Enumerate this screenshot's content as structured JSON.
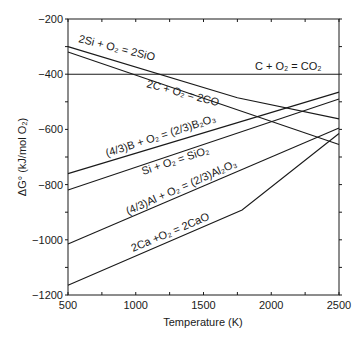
{
  "chart_data": {
    "type": "line",
    "title": "",
    "xlabel": "Temperature (K)",
    "ylabel": "ΔG° (kJ/mol O₂)",
    "xlim": [
      500,
      2500
    ],
    "ylim": [
      -1200,
      -200
    ],
    "x_ticks": [
      500,
      1000,
      1500,
      2000,
      2500
    ],
    "y_ticks": [
      -200,
      -400,
      -600,
      -800,
      -1000,
      -1200
    ],
    "grid": false,
    "legend": "inline labels",
    "series": [
      {
        "name": "2Si + O2 = 2SiO",
        "points": [
          [
            500,
            -300
          ],
          [
            1750,
            -485
          ],
          [
            2500,
            -562
          ]
        ]
      },
      {
        "name": "2C + O2 = 2CO",
        "points": [
          [
            500,
            -320
          ],
          [
            2500,
            -655
          ]
        ]
      },
      {
        "name": "C + O2 = CO2",
        "points": [
          [
            500,
            -400
          ],
          [
            2500,
            -400
          ]
        ]
      },
      {
        "name": "(4/3)B + O2 = (2/3)B2O3",
        "points": [
          [
            500,
            -760
          ],
          [
            2500,
            -465
          ]
        ]
      },
      {
        "name": "Si + O2 = SiO2",
        "points": [
          [
            500,
            -820
          ],
          [
            2500,
            -490
          ]
        ]
      },
      {
        "name": "(4/3)Al + O2 = (2/3)Al2O3",
        "points": [
          [
            500,
            -1015
          ],
          [
            2500,
            -595
          ]
        ]
      },
      {
        "name": "2Ca + O2 = 2CaO",
        "points": [
          [
            500,
            -1165
          ],
          [
            1785,
            -892
          ],
          [
            2500,
            -615
          ]
        ]
      }
    ]
  },
  "labels": {
    "sio": "2Si + O₂ = 2SiO",
    "co": "2C + O₂ = 2CO",
    "co2": "C + O₂ = CO₂",
    "b2o3": "(4/3)B + O₂ = (2/3)B₂O₃",
    "sio2": "Si + O₂ = SiO₂",
    "al2o3": "(4/3)Al + O₂ = (2/3)Al₂O₃",
    "cao": "2Ca +O₂ = 2CaO",
    "xlabel": "Temperature (K)",
    "ylabel": "ΔG° (kJ/mol O₂)",
    "xticks": [
      "500",
      "1000",
      "1500",
      "2000",
      "2500"
    ],
    "yticks": [
      "−200",
      "−400",
      "−600",
      "−800",
      "−1000",
      "−1200"
    ]
  }
}
